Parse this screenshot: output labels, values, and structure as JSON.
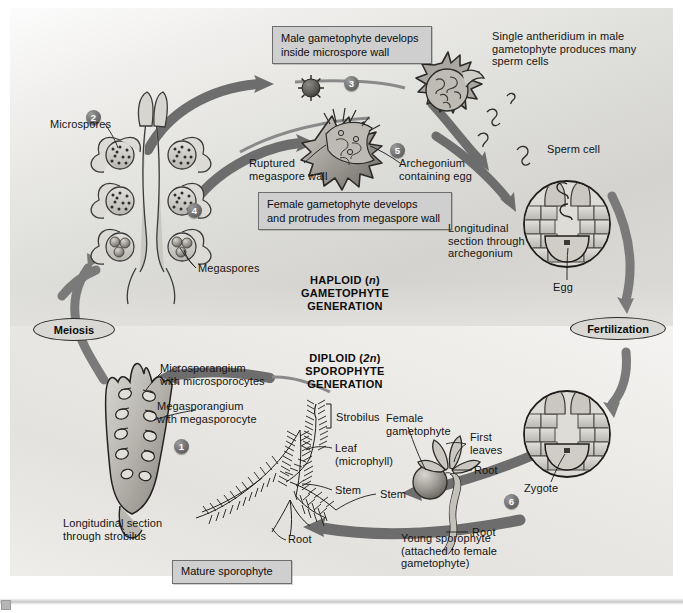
{
  "figure": {
    "zones": {
      "haploid": {
        "caption_line1": "HAPLOID (n)",
        "caption_line2": "GAMETOPHYTE",
        "caption_line3": "GENERATION",
        "italic_token": "n"
      },
      "diploid": {
        "caption_line1": "DIPLOID (2n)",
        "caption_line2": "SPOROPHYTE",
        "caption_line3": "GENERATION",
        "italic_token": "2n"
      }
    },
    "processes": [
      {
        "id": "meiosis",
        "label": "Meiosis"
      },
      {
        "id": "fertilization",
        "label": "Fertilization"
      }
    ],
    "steps": [
      {
        "number": "1"
      },
      {
        "number": "2"
      },
      {
        "number": "3"
      },
      {
        "number": "4"
      },
      {
        "number": "5"
      },
      {
        "number": "6"
      }
    ],
    "callout_boxes": [
      {
        "id": "male-gametophyte",
        "text": "Male gametophyte develops\ninside microspore wall"
      },
      {
        "id": "female-gametophyte",
        "text": "Female gametophyte develops\nand protrudes from megaspore wall"
      },
      {
        "id": "mature-sporophyte",
        "text": "Mature sporophyte"
      }
    ],
    "labels": [
      {
        "id": "microspores",
        "text": "Microspores"
      },
      {
        "id": "megaspores",
        "text": "Megaspores"
      },
      {
        "id": "antheridium",
        "text": "Single antheridium in male\ngametophyte produces many\nsperm cells"
      },
      {
        "id": "sperm-cell",
        "text": "Sperm cell"
      },
      {
        "id": "ruptured-megaspore-wall",
        "text": "Ruptured\nmegaspore wall"
      },
      {
        "id": "archegonium-containing-egg",
        "text": "Archegonium\ncontaining egg"
      },
      {
        "id": "longitudinal-archegonium",
        "text": "Longitudinal\nsection through\narchegonium"
      },
      {
        "id": "egg",
        "text": "Egg"
      },
      {
        "id": "zygote",
        "text": "Zygote"
      },
      {
        "id": "microsporangium",
        "text": "Microsporangium\nwith microsporocytes"
      },
      {
        "id": "megasporangium",
        "text": "Megasporangium\nwith megasporocyte"
      },
      {
        "id": "longitudinal-strobilus",
        "text": "Longitudinal section\nthrough strobilus"
      },
      {
        "id": "strobilus",
        "text": "Strobilus"
      },
      {
        "id": "leaf-microphyll",
        "text": "Leaf\n(microphyll)"
      },
      {
        "id": "stem-sporophyte",
        "text": "Stem"
      },
      {
        "id": "root-sporophyte",
        "text": "Root"
      },
      {
        "id": "stem-mature",
        "text": "Stem"
      },
      {
        "id": "root-mature",
        "text": "Root"
      },
      {
        "id": "female-gametophyte-label",
        "text": "Female\ngametophyte"
      },
      {
        "id": "first-leaves",
        "text": "First\nleaves"
      },
      {
        "id": "young-sporophyte",
        "text": "Young sporophyte\n(attached to female\ngametophyte)"
      }
    ],
    "colors": {
      "arrow": "#6f6f6f",
      "arrow_dark": "#5a5a5a",
      "box_fill": "#cfcfcf",
      "box_border": "#6e6e6e",
      "text": "#141414",
      "haploid_bg": "#d8d7d3",
      "diploid_bg": "#eceae7",
      "structure_line": "#2a2a2a"
    }
  }
}
